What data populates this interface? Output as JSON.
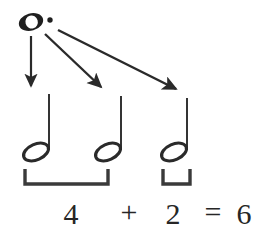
{
  "figure": {
    "background_color": "#ffffff",
    "ink_color": "#1f1f1f"
  },
  "source_note": {
    "name": "dotted-whole-note",
    "symbol": "whole-note-with-dot",
    "beats": 6,
    "position": {
      "x": 31,
      "y": 22
    }
  },
  "arrows": [
    {
      "label": "arrow-to-first-half-note",
      "from": {
        "x": 31,
        "y": 36
      },
      "to": {
        "x": 31,
        "y": 88
      }
    },
    {
      "label": "arrow-to-second-half-note",
      "from": {
        "x": 44,
        "y": 34
      },
      "to": {
        "x": 103,
        "y": 90
      }
    },
    {
      "label": "arrow-to-third-half-note",
      "from": {
        "x": 57,
        "y": 31
      },
      "to": {
        "x": 178,
        "y": 92
      }
    }
  ],
  "half_notes": [
    {
      "label": "half-note-1",
      "head_x": 34,
      "head_y": 150,
      "stem_x": 49,
      "stem_top": 94,
      "beats": 2
    },
    {
      "label": "half-note-2",
      "head_x": 106,
      "head_y": 150,
      "stem_x": 121,
      "stem_top": 96,
      "beats": 2
    },
    {
      "label": "half-note-3",
      "head_x": 172,
      "head_y": 150,
      "stem_x": 187,
      "stem_top": 98,
      "beats": 2
    }
  ],
  "brackets": [
    {
      "label": "bracket-left",
      "x1": 25,
      "x2": 109,
      "top": 170,
      "bottom": 185,
      "groups_notes": 2,
      "value": "4"
    },
    {
      "label": "bracket-right",
      "x1": 162,
      "x2": 191,
      "top": 170,
      "bottom": 185,
      "groups_notes": 1,
      "value": "2"
    }
  ],
  "equation": {
    "full_text": "4 + 2 = 6",
    "terms": [
      {
        "name": "addend-first",
        "text": "4",
        "x": 71,
        "y": 224
      },
      {
        "name": "plus-operator",
        "text": "+",
        "x": 129,
        "y": 222
      },
      {
        "name": "addend-second",
        "text": "2",
        "x": 173,
        "y": 224
      },
      {
        "name": "equals-operator",
        "text": "=",
        "x": 213,
        "y": 222
      },
      {
        "name": "sum-result",
        "text": "6",
        "x": 244,
        "y": 224
      }
    ]
  }
}
